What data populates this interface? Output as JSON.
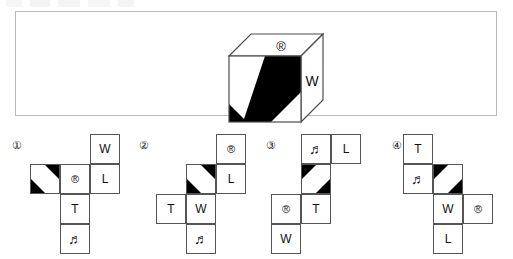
{
  "document": {
    "type": "puzzle-question",
    "description": "Cube net matching problem: a 3D cube with a diagonal striped front face, a registered-trademark symbol on the top face and the letter W on the right face, followed by four candidate unfolded-net answer choices."
  },
  "question": {
    "panel_label": "cube-figure-panel",
    "cube": {
      "front_face": {
        "name": "diagonal-stripe-face",
        "pattern": "diagonal-stripes",
        "direction": "top-right-to-bottom-left",
        "colors": [
          "#000000",
          "#ffffff"
        ]
      },
      "top_face": {
        "name": "registered-face",
        "label": "®"
      },
      "right_face": {
        "name": "w-face",
        "label": "W"
      }
    }
  },
  "colors": {
    "ink": "#111111",
    "stroke": "#555555",
    "panel_border": "#b9b9b9",
    "fill_black": "#000000",
    "fill_white": "#ffffff",
    "page_background": "#ffffff"
  },
  "glyphs": {
    "registered": "®",
    "music_note": "♬",
    "letter_w": "W",
    "letter_l": "L",
    "letter_t": "T"
  },
  "options": [
    {
      "number": "①",
      "name": "option-1",
      "stripe_direction": "top-right-to-bottom-left",
      "cells": [
        {
          "row": 1,
          "col": 3,
          "type": "text",
          "label": "W"
        },
        {
          "row": 2,
          "col": 1,
          "type": "stripe",
          "label": ""
        },
        {
          "row": 2,
          "col": 2,
          "type": "reg",
          "label": "®"
        },
        {
          "row": 2,
          "col": 3,
          "type": "text",
          "label": "L"
        },
        {
          "row": 3,
          "col": 2,
          "type": "text",
          "label": "T"
        },
        {
          "row": 4,
          "col": 2,
          "type": "note",
          "label": "♬"
        }
      ]
    },
    {
      "number": "②",
      "name": "option-2",
      "stripe_direction": "top-right-to-bottom-left",
      "cells": [
        {
          "row": 1,
          "col": 3,
          "type": "reg",
          "label": "®"
        },
        {
          "row": 2,
          "col": 2,
          "type": "stripe",
          "label": ""
        },
        {
          "row": 2,
          "col": 3,
          "type": "text",
          "label": "L"
        },
        {
          "row": 3,
          "col": 1,
          "type": "text",
          "label": "T"
        },
        {
          "row": 3,
          "col": 2,
          "type": "text",
          "label": "W"
        },
        {
          "row": 4,
          "col": 2,
          "type": "note",
          "label": "♬"
        }
      ]
    },
    {
      "number": "③",
      "name": "option-3",
      "stripe_direction": "top-left-to-bottom-right",
      "cells": [
        {
          "row": 1,
          "col": 2,
          "type": "note",
          "label": "♬"
        },
        {
          "row": 1,
          "col": 3,
          "type": "text",
          "label": "L"
        },
        {
          "row": 2,
          "col": 2,
          "type": "stripe",
          "label": ""
        },
        {
          "row": 3,
          "col": 1,
          "type": "reg",
          "label": "®"
        },
        {
          "row": 3,
          "col": 2,
          "type": "text",
          "label": "T"
        },
        {
          "row": 4,
          "col": 1,
          "type": "text",
          "label": "W"
        }
      ]
    },
    {
      "number": "④",
      "name": "option-4",
      "stripe_direction": "top-left-to-bottom-right",
      "cells": [
        {
          "row": 1,
          "col": 1,
          "type": "text",
          "label": "T"
        },
        {
          "row": 2,
          "col": 1,
          "type": "note",
          "label": "♬"
        },
        {
          "row": 2,
          "col": 2,
          "type": "stripe",
          "label": ""
        },
        {
          "row": 3,
          "col": 2,
          "type": "text",
          "label": "W"
        },
        {
          "row": 3,
          "col": 3,
          "type": "reg",
          "label": "®"
        },
        {
          "row": 4,
          "col": 2,
          "type": "text",
          "label": "L"
        }
      ]
    }
  ]
}
